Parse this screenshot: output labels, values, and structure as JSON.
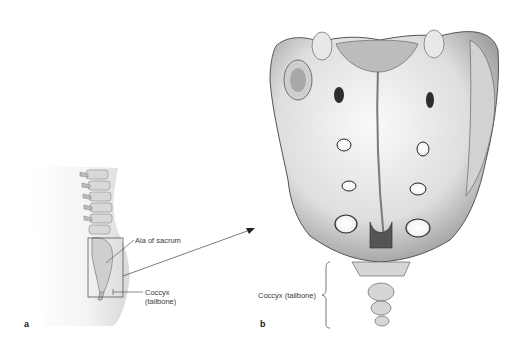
{
  "figure": {
    "panel_a": {
      "letter": "a",
      "description": "Lateral view of lower torso showing lumbar spine, sacrum and coccyx with inset box",
      "labels": {
        "ala": "Ala of sacrum",
        "coccyx_line1": "Coccyx",
        "coccyx_line2": "(tailbone)"
      }
    },
    "panel_b": {
      "letter": "b",
      "description": "Enlarged posterior view of sacrum and coccyx",
      "labels": {
        "coccyx": "Coccyx (tailbone)"
      }
    },
    "colors": {
      "bone_light": "#f2f2f2",
      "bone_mid": "#c8c8c8",
      "bone_dark": "#6e6e6e",
      "body_shade": "#e6e6e6",
      "line": "#444444"
    }
  }
}
